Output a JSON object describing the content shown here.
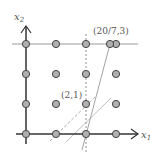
{
  "diagram": {
    "axes": {
      "x_label": "x",
      "x_sub": "1",
      "y_label": "x",
      "y_sub": "2"
    },
    "annotations": [
      {
        "text": "(20/7,3)"
      },
      {
        "text": "(2,1)"
      }
    ],
    "lattice": {
      "cols": [
        0,
        1,
        2,
        3
      ],
      "rows": [
        0,
        1,
        2,
        3
      ]
    },
    "colors": {
      "point_fill": "#b0b0b0",
      "point_stroke": "#444444",
      "axis": "#333333",
      "line": "#999999"
    }
  }
}
